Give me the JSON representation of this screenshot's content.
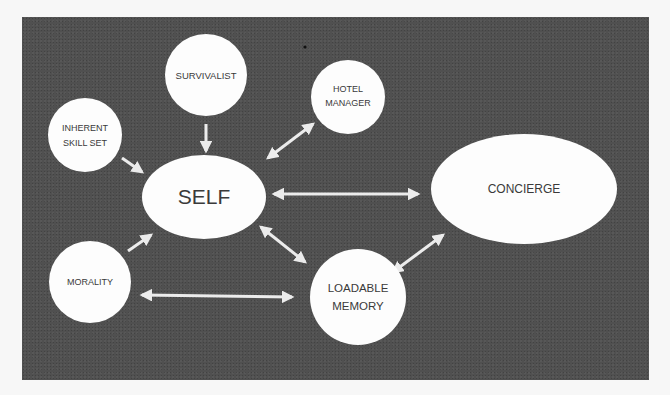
{
  "diagram": {
    "title": "",
    "background_color": "#505050",
    "node_color": "#fdfdfd",
    "text_color": "#3a3a3a",
    "arrow_color": "#ececec",
    "nodes": {
      "survivalist": {
        "label": "SURVIVALIST",
        "shape": "circle"
      },
      "hotel_manager": {
        "label_line1": "HOTEL",
        "label_line2": "MANAGER",
        "shape": "circle"
      },
      "inherent_skill_set": {
        "label_line1": "INHERENT",
        "label_line2": "SKILL SET",
        "shape": "circle"
      },
      "self": {
        "label": "SELF",
        "shape": "ellipse"
      },
      "concierge": {
        "label": "CONCIERGE",
        "shape": "ellipse"
      },
      "morality": {
        "label": "MORALITY",
        "shape": "circle"
      },
      "loadable_memory": {
        "label_line1": "LOADABLE",
        "label_line2": "MEMORY",
        "shape": "circle"
      }
    },
    "edges": [
      {
        "from": "SURVIVALIST",
        "to": "SELF",
        "direction": "one-way"
      },
      {
        "from": "INHERENT SKILL SET",
        "to": "SELF",
        "direction": "one-way"
      },
      {
        "from": "MORALITY",
        "to": "SELF",
        "direction": "one-way"
      },
      {
        "from": "HOTEL MANAGER",
        "to": "SELF",
        "direction": "two-way"
      },
      {
        "from": "SELF",
        "to": "CONCIERGE",
        "direction": "two-way"
      },
      {
        "from": "SELF",
        "to": "LOADABLE MEMORY",
        "direction": "two-way"
      },
      {
        "from": "MORALITY",
        "to": "LOADABLE MEMORY",
        "direction": "two-way"
      },
      {
        "from": "LOADABLE MEMORY",
        "to": "CONCIERGE",
        "direction": "two-way"
      }
    ]
  }
}
